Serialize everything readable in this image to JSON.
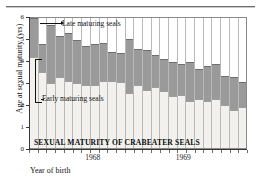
{
  "chart_data": {
    "type": "bar",
    "subtype": "range-bar-stacked",
    "title": "SEXUAL MATURITY OF CRABEATER SEALS",
    "xlabel": "Year of birth",
    "ylabel": "Age at sexual maturity (yrs)",
    "ylim": [
      0,
      6
    ],
    "yticks": [
      0,
      1,
      2,
      3,
      4,
      5,
      6
    ],
    "ytick_labels": [
      "0",
      "1",
      "2",
      "3",
      "4",
      "5",
      "6"
    ],
    "xtick_labels": [
      "1968",
      "1969"
    ],
    "xtick_positions_pct": [
      29.2,
      70.8
    ],
    "grid": "vertical column separators only",
    "legend": "inline annotations",
    "annotations": [
      {
        "text": "Late maturing seals",
        "points_to": "upper grey segment"
      },
      {
        "text": "Early maturing seals",
        "points_to": "lower light segment"
      }
    ],
    "series": [
      {
        "name": "Early maturing seals",
        "color": "#f2f1ee",
        "values": [
          4.25,
          3.55,
          3.05,
          3.3,
          3.15,
          3.05,
          2.95,
          2.95,
          3.15,
          3.15,
          3.1,
          2.6,
          2.95,
          2.75,
          2.85,
          2.7,
          2.45,
          2.5,
          2.25,
          2.3,
          2.25,
          2.3,
          2.05,
          1.8,
          1.95
        ]
      },
      {
        "name": "Late maturing seals",
        "color": "#9a9a9a",
        "values": [
          6.0,
          4.8,
          5.7,
          5.2,
          5.3,
          5.0,
          4.75,
          4.8,
          4.85,
          4.45,
          4.4,
          5.05,
          4.6,
          4.55,
          4.3,
          4.15,
          4.0,
          3.9,
          4.0,
          3.7,
          3.8,
          3.9,
          3.35,
          3.3,
          3.1
        ]
      }
    ],
    "n_bars": 25
  },
  "axis": {
    "y_title": "Age at sexual maturity (yrs)",
    "x_title": "Year of birth"
  },
  "plot_title": "SEXUAL MATURITY OF CRABEATER SEALS",
  "colors": {
    "late_fill": "#9a9a9a",
    "early_fill": "#f2f1ee",
    "axis": "#3a3a3a",
    "grid": "#b9b9b9",
    "text": "#111111"
  }
}
